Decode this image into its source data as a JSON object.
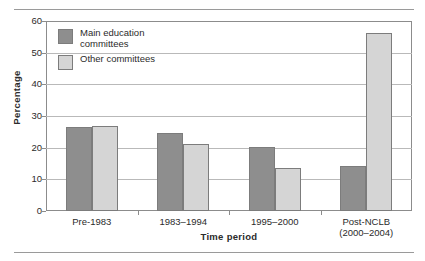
{
  "figure": {
    "top_rule_caption_fragment": "",
    "colors": {
      "series_main": "#8e8e8e",
      "series_other": "#d5d5d5",
      "bar_outline": "#7c7c7c",
      "gridline": "#b9b9b9",
      "axis": "#8c8c8c",
      "text": "#2b2b2b",
      "background": "#ffffff"
    }
  },
  "chart_data": {
    "type": "bar",
    "title": "",
    "xlabel": "Time period",
    "ylabel": "Percentage",
    "ylim": [
      0,
      60
    ],
    "yticks": [
      0,
      10,
      20,
      30,
      40,
      50,
      60
    ],
    "ytick_labels": [
      "0",
      "10",
      "20",
      "30",
      "40",
      "50",
      "60"
    ],
    "grid": true,
    "grid_axis": "y",
    "legend_position": "upper left (inside plot)",
    "categories": [
      "Pre-1983",
      "1983–1994",
      "1995–2000",
      "Post-NCLB"
    ],
    "category_sublabels": [
      "",
      "",
      "",
      "(2000–2004)"
    ],
    "series": [
      {
        "name": "Main education committees",
        "legend_label_line1": "Main education",
        "legend_label_line2": "committees",
        "color": "#8e8e8e",
        "values": [
          26.5,
          24.5,
          20.2,
          14.2
        ]
      },
      {
        "name": "Other committees",
        "legend_label_line1": "Other committees",
        "legend_label_line2": "",
        "color": "#d5d5d5",
        "values": [
          27.0,
          21.2,
          13.5,
          56.3
        ]
      }
    ]
  }
}
